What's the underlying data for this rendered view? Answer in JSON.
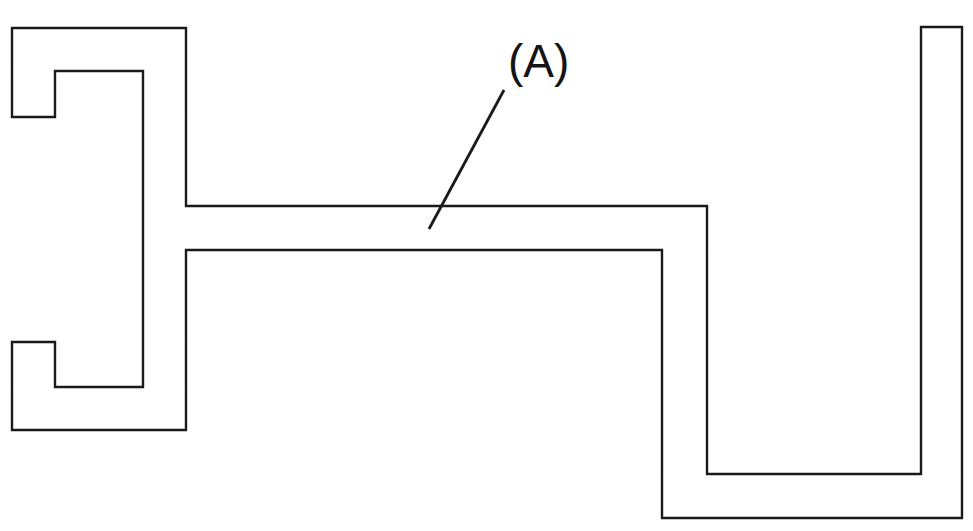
{
  "drawing": {
    "title": "Sectional profile outline drawing",
    "canvas": {
      "width": 973,
      "height": 531,
      "background": "#ffffff"
    },
    "line_style": {
      "stroke_color": "#1a1a1a",
      "stroke_width": 2.4,
      "fill": "none"
    },
    "profile": {
      "name": "extruded-profile-cross-section",
      "closed": true,
      "points": [
        [
          12,
          28
        ],
        [
          186,
          28
        ],
        [
          186,
          206
        ],
        [
          707,
          206
        ],
        [
          707,
          474
        ],
        [
          921,
          474
        ],
        [
          921,
          27
        ],
        [
          962,
          27
        ],
        [
          962,
          518
        ],
        [
          662,
          518
        ],
        [
          662,
          250
        ],
        [
          186,
          250
        ],
        [
          186,
          430
        ],
        [
          12,
          430
        ],
        [
          12,
          342
        ],
        [
          55,
          342
        ],
        [
          55,
          387
        ],
        [
          143,
          387
        ],
        [
          143,
          71
        ],
        [
          55,
          71
        ],
        [
          55,
          117
        ],
        [
          12,
          117
        ]
      ],
      "path_d": "M 12 28 L 186 28 L 186 206 L 707 206 L 707 474 L 921 474 L 921 27 L 962 27 L 962 518 L 662 518 L 662 250 L 186 250 L 186 430 L 12 430 L 12 342 L 55 342 L 55 387 L 143 387 L 143 71 L 55 71 L 55 117 L 12 117 Z"
    },
    "callout": {
      "name": "callout-a",
      "label": "(A)",
      "label_x": 508,
      "label_y": 38,
      "leader_line": {
        "name": "leader-line-a",
        "x1": 504,
        "y1": 90,
        "x2": 429,
        "y2": 229,
        "path_d": "M 504 90 L 429 229"
      }
    }
  }
}
